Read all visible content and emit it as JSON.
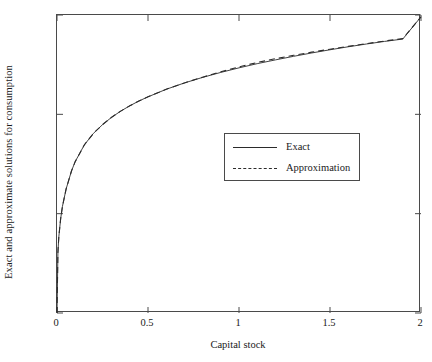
{
  "chart_data": {
    "type": "line",
    "title": "",
    "xlabel": "Capital stock",
    "ylabel": "Exact and approximate solutions for consumption",
    "xlim": [
      0,
      2
    ],
    "ylim": [
      0,
      0.15
    ],
    "grid": false,
    "legend_position": "center-right",
    "xticks": [
      {
        "value": 0,
        "label": "0"
      },
      {
        "value": 0.5,
        "label": "0.5"
      },
      {
        "value": 1,
        "label": "1"
      },
      {
        "value": 1.5,
        "label": "1.5"
      },
      {
        "value": 2,
        "label": "2"
      }
    ],
    "yticks": [
      {
        "value": 0,
        "label": "0"
      },
      {
        "value": 0.05,
        "label": "0.05"
      },
      {
        "value": 0.1,
        "label": "0.1"
      },
      {
        "value": 0.15,
        "label": "0.15"
      }
    ],
    "series": [
      {
        "name": "Exact",
        "style": "solid",
        "color": "#2b2b2b",
        "x": [
          0,
          0.005,
          0.01,
          0.02,
          0.03,
          0.05,
          0.08,
          0.1,
          0.15,
          0.2,
          0.25,
          0.3,
          0.35,
          0.4,
          0.45,
          0.5,
          0.6,
          0.7,
          0.8,
          0.9,
          1.0,
          1.1,
          1.2,
          1.3,
          1.4,
          1.5,
          1.6,
          1.7,
          1.8,
          1.9,
          2.0
        ],
        "y": [
          0,
          0.0305,
          0.0383,
          0.0474,
          0.0537,
          0.0624,
          0.0716,
          0.0762,
          0.0846,
          0.0904,
          0.0948,
          0.0985,
          0.1016,
          0.1043,
          0.1067,
          0.1088,
          0.1126,
          0.1158,
          0.1186,
          0.1211,
          0.1234,
          0.1255,
          0.1274,
          0.1292,
          0.1309,
          0.1325,
          0.134,
          0.1354,
          0.1367,
          0.1379,
          0.1491
        ]
      },
      {
        "name": "Approximation",
        "style": "dashed",
        "color": "#2b2b2b",
        "x": [
          0,
          0.005,
          0.01,
          0.02,
          0.03,
          0.05,
          0.08,
          0.1,
          0.15,
          0.2,
          0.25,
          0.3,
          0.35,
          0.4,
          0.45,
          0.5,
          0.6,
          0.7,
          0.8,
          0.9,
          1.0,
          1.1,
          1.2,
          1.3,
          1.4,
          1.5,
          1.6,
          1.7,
          1.8,
          1.9,
          2.0
        ],
        "y": [
          0,
          0.0305,
          0.0383,
          0.0474,
          0.0537,
          0.0624,
          0.0716,
          0.0762,
          0.0846,
          0.0904,
          0.0948,
          0.0985,
          0.1016,
          0.1043,
          0.1067,
          0.1088,
          0.1126,
          0.1158,
          0.1187,
          0.1214,
          0.1239,
          0.1261,
          0.128,
          0.1297,
          0.1313,
          0.1328,
          0.1342,
          0.1356,
          0.1369,
          0.1381,
          0.1491
        ]
      }
    ],
    "legend": [
      {
        "label": "Exact",
        "style": "solid"
      },
      {
        "label": "Approximation",
        "style": "dashed"
      }
    ]
  }
}
